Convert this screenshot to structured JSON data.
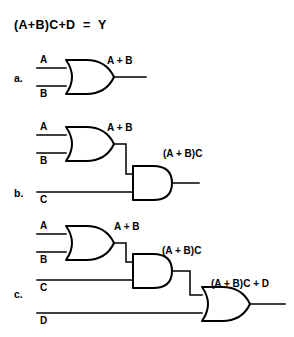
{
  "figure": {
    "title": "(A+B)C+D  =  Y",
    "background_color": "#ffffff",
    "line_color": "#000000",
    "width": 294,
    "height": 337
  },
  "steps": [
    {
      "key": "a",
      "label": "a.",
      "gates": [
        {
          "type": "or-gate",
          "name": "or-gate-ab",
          "inputs": [
            "A",
            "B"
          ],
          "output_label": "A + B"
        }
      ],
      "input_labels": [
        "A",
        "B"
      ],
      "output_labels": [
        "A + B"
      ]
    },
    {
      "key": "b",
      "label": "b.",
      "gates": [
        {
          "type": "or-gate",
          "name": "or-gate-ab",
          "inputs": [
            "A",
            "B"
          ],
          "output_label": "A + B"
        },
        {
          "type": "and-gate",
          "name": "and-gate-abc",
          "inputs": [
            "A + B",
            "C"
          ],
          "output_label": "(A + B)C"
        }
      ],
      "input_labels": [
        "A",
        "B",
        "C"
      ],
      "output_labels": [
        "A + B",
        "(A + B)C"
      ]
    },
    {
      "key": "c",
      "label": "c.",
      "gates": [
        {
          "type": "or-gate",
          "name": "or-gate-ab",
          "inputs": [
            "A",
            "B"
          ],
          "output_label": "A + B"
        },
        {
          "type": "and-gate",
          "name": "and-gate-abc",
          "inputs": [
            "A + B",
            "C"
          ],
          "output_label": "(A + B)C"
        },
        {
          "type": "or-gate",
          "name": "or-gate-final",
          "inputs": [
            "(A + B)C",
            "D"
          ],
          "output_label": "(A + B)C + D"
        }
      ],
      "input_labels": [
        "A",
        "B",
        "C",
        "D"
      ],
      "output_labels": [
        "A + B",
        "(A + B)C",
        "(A + B)C + D"
      ]
    }
  ],
  "labels": {
    "a_step": "a.",
    "b_step": "b.",
    "c_step": "c.",
    "a_in_A": "A",
    "a_in_B": "B",
    "a_out": "A + B",
    "b_in_A": "A",
    "b_in_B": "B",
    "b_in_C": "C",
    "b_out_or": "A + B",
    "b_out_and": "(A + B)C",
    "c_in_A": "A",
    "c_in_B": "B",
    "c_in_C": "C",
    "c_in_D": "D",
    "c_out_or": "A + B",
    "c_out_and": "(A + B)C",
    "c_out_final": "(A + B)C + D"
  }
}
